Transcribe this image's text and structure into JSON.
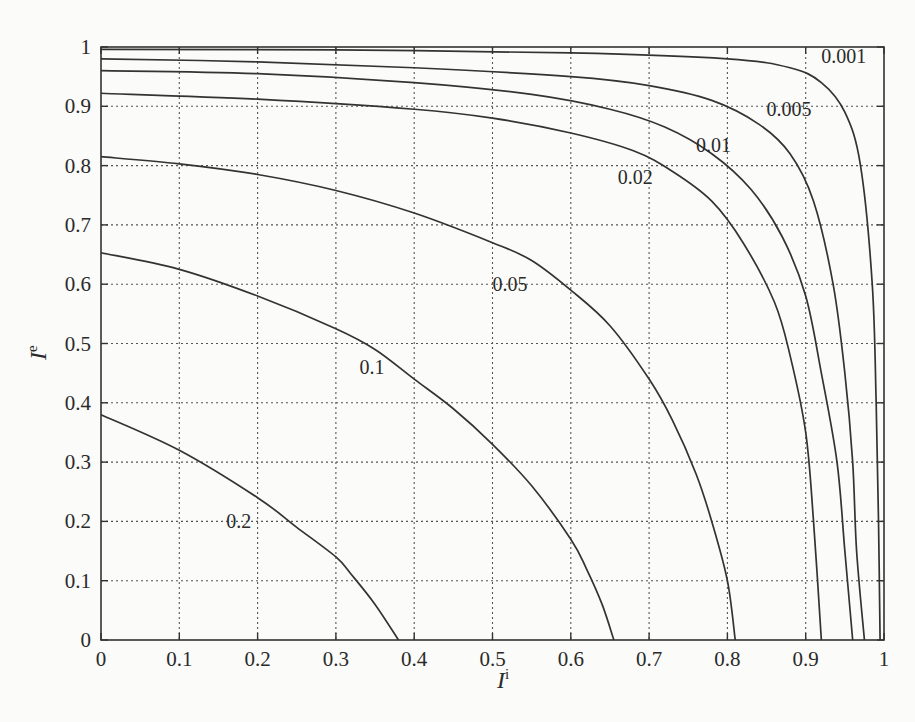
{
  "chart_data": {
    "type": "line",
    "title": "",
    "xlabel": "I^i",
    "ylabel": "I^e",
    "xlabel_base": "I",
    "xlabel_sup": "i",
    "ylabel_base": "I",
    "ylabel_sup": "e",
    "xlim": [
      0,
      1
    ],
    "ylim": [
      0,
      1
    ],
    "grid": true,
    "legend": "inline curve labels",
    "x_ticks": [
      "0",
      "0.1",
      "0.2",
      "0.3",
      "0.4",
      "0.5",
      "0.6",
      "0.7",
      "0.8",
      "0.9",
      "1"
    ],
    "y_ticks": [
      "0",
      "0.1",
      "0.2",
      "0.3",
      "0.4",
      "0.5",
      "0.6",
      "0.7",
      "0.8",
      "0.9",
      "1"
    ],
    "series": [
      {
        "name": "0.001",
        "label_pos": [
          0.92,
          0.985
        ],
        "points": [
          [
            0,
            0.996
          ],
          [
            0.3,
            0.995
          ],
          [
            0.6,
            0.99
          ],
          [
            0.8,
            0.98
          ],
          [
            0.88,
            0.965
          ],
          [
            0.92,
            0.94
          ],
          [
            0.95,
            0.89
          ],
          [
            0.97,
            0.8
          ],
          [
            0.985,
            0.6
          ],
          [
            0.99,
            0.4
          ],
          [
            0.993,
            0.2
          ],
          [
            0.995,
            0
          ]
        ]
      },
      {
        "name": "0.005",
        "label_pos": [
          0.85,
          0.895
        ],
        "points": [
          [
            0,
            0.98
          ],
          [
            0.2,
            0.975
          ],
          [
            0.4,
            0.965
          ],
          [
            0.6,
            0.95
          ],
          [
            0.7,
            0.935
          ],
          [
            0.78,
            0.91
          ],
          [
            0.84,
            0.87
          ],
          [
            0.88,
            0.82
          ],
          [
            0.91,
            0.74
          ],
          [
            0.935,
            0.6
          ],
          [
            0.95,
            0.45
          ],
          [
            0.96,
            0.3
          ],
          [
            0.965,
            0.15
          ],
          [
            0.975,
            0
          ]
        ]
      },
      {
        "name": "0.01",
        "label_pos": [
          0.76,
          0.835
        ],
        "points": [
          [
            0,
            0.96
          ],
          [
            0.2,
            0.955
          ],
          [
            0.4,
            0.94
          ],
          [
            0.55,
            0.92
          ],
          [
            0.65,
            0.895
          ],
          [
            0.72,
            0.865
          ],
          [
            0.78,
            0.82
          ],
          [
            0.83,
            0.76
          ],
          [
            0.87,
            0.68
          ],
          [
            0.9,
            0.58
          ],
          [
            0.92,
            0.45
          ],
          [
            0.94,
            0.3
          ],
          [
            0.95,
            0.15
          ],
          [
            0.96,
            0
          ]
        ]
      },
      {
        "name": "0.02",
        "label_pos": [
          0.66,
          0.78
        ],
        "points": [
          [
            0,
            0.922
          ],
          [
            0.2,
            0.912
          ],
          [
            0.4,
            0.895
          ],
          [
            0.5,
            0.88
          ],
          [
            0.6,
            0.855
          ],
          [
            0.68,
            0.825
          ],
          [
            0.73,
            0.79
          ],
          [
            0.78,
            0.74
          ],
          [
            0.82,
            0.67
          ],
          [
            0.86,
            0.57
          ],
          [
            0.88,
            0.48
          ],
          [
            0.9,
            0.35
          ],
          [
            0.91,
            0.2
          ],
          [
            0.92,
            0
          ]
        ]
      },
      {
        "name": "0.05",
        "label_pos": [
          0.5,
          0.6
        ],
        "points": [
          [
            0,
            0.815
          ],
          [
            0.1,
            0.803
          ],
          [
            0.2,
            0.785
          ],
          [
            0.3,
            0.758
          ],
          [
            0.4,
            0.72
          ],
          [
            0.5,
            0.67
          ],
          [
            0.55,
            0.64
          ],
          [
            0.6,
            0.59
          ],
          [
            0.65,
            0.53
          ],
          [
            0.7,
            0.44
          ],
          [
            0.73,
            0.37
          ],
          [
            0.76,
            0.28
          ],
          [
            0.78,
            0.2
          ],
          [
            0.8,
            0.1
          ],
          [
            0.81,
            0
          ]
        ]
      },
      {
        "name": "0.1",
        "label_pos": [
          0.33,
          0.46
        ],
        "points": [
          [
            0,
            0.653
          ],
          [
            0.1,
            0.625
          ],
          [
            0.2,
            0.58
          ],
          [
            0.3,
            0.525
          ],
          [
            0.35,
            0.49
          ],
          [
            0.4,
            0.44
          ],
          [
            0.45,
            0.39
          ],
          [
            0.5,
            0.33
          ],
          [
            0.55,
            0.26
          ],
          [
            0.6,
            0.17
          ],
          [
            0.62,
            0.12
          ],
          [
            0.64,
            0.06
          ],
          [
            0.655,
            0
          ]
        ]
      },
      {
        "name": "0.2",
        "label_pos": [
          0.16,
          0.2
        ],
        "points": [
          [
            0,
            0.38
          ],
          [
            0.1,
            0.32
          ],
          [
            0.2,
            0.24
          ],
          [
            0.25,
            0.19
          ],
          [
            0.3,
            0.14
          ],
          [
            0.32,
            0.11
          ],
          [
            0.35,
            0.06
          ],
          [
            0.38,
            0
          ]
        ]
      }
    ]
  }
}
